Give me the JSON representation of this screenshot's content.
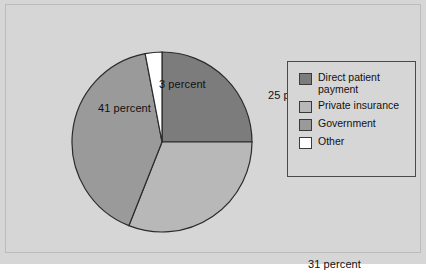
{
  "figure": {
    "background_color": "#d6d6d6",
    "frame_border_color": "#bcbcbc"
  },
  "chart_data": {
    "type": "pie",
    "title": "",
    "subtitle": "",
    "xlabel": "",
    "ylabel": "",
    "grid": false,
    "legend_position": "right",
    "start_angle_deg": 0,
    "direction": "clockwise",
    "categories": [
      "Direct patient payment",
      "Private insurance",
      "Government",
      "Other"
    ],
    "values": [
      25,
      31,
      41,
      3
    ],
    "value_unit": "percent",
    "slice_colors": [
      "#7c7c7c",
      "#b8b8b8",
      "#9a9a9a",
      "#ffffff"
    ],
    "slice_edge_color": "#2b2b2b",
    "data_labels": [
      "25 percent",
      "31 percent",
      "41 percent",
      "3 percent"
    ],
    "annotations": [
      {
        "name": "other-label",
        "text": "3 percent",
        "category": "Other"
      },
      {
        "name": "direct-label",
        "text": "25 percent",
        "category": "Direct patient payment"
      },
      {
        "name": "government-label",
        "text": "41 percent",
        "category": "Government"
      },
      {
        "name": "private-label",
        "text": "31 percent",
        "category": "Private insurance"
      }
    ]
  },
  "legend": {
    "border_color": "#4a4a4a",
    "items": [
      {
        "label": "Direct patient\npayment",
        "color": "#7c7c7c",
        "value": 25
      },
      {
        "label": "Private insurance",
        "color": "#b8b8b8",
        "value": 31
      },
      {
        "label": "Government",
        "color": "#9a9a9a",
        "value": 41
      },
      {
        "label": "Other",
        "color": "#ffffff",
        "value": 3
      }
    ]
  }
}
